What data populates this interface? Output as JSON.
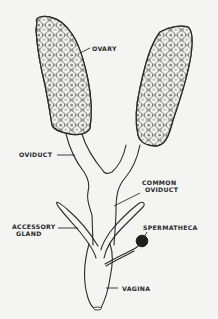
{
  "diagram": {
    "title": "",
    "labels": {
      "ovary": "OVARY",
      "oviduct": "OVIDUCT",
      "common_oviduct_line1": "COMMON",
      "common_oviduct_line2": "OVIDUCT",
      "accessory_gland_line1": "ACCESSORY",
      "accessory_gland_line2": "GLAND",
      "spermatheca": "SPERMATHECA",
      "vagina": "VAGINA"
    },
    "structures": [
      {
        "name": "ovary-left",
        "type": "paired ovary",
        "fill": "cellular"
      },
      {
        "name": "ovary-right",
        "type": "paired ovary",
        "fill": "cellular"
      },
      {
        "name": "oviduct-left",
        "type": "lateral oviduct"
      },
      {
        "name": "oviduct-right",
        "type": "lateral oviduct"
      },
      {
        "name": "common-oviduct",
        "type": "duct"
      },
      {
        "name": "accessory-gland-left",
        "type": "gland"
      },
      {
        "name": "accessory-gland-right",
        "type": "gland"
      },
      {
        "name": "spermatheca",
        "type": "sac",
        "fill": "dark"
      },
      {
        "name": "vagina",
        "type": "chamber"
      }
    ],
    "colors": {
      "background": "#f4f4f2",
      "line": "#2b2b2b",
      "spermatheca_fill": "#1e1e1e"
    }
  }
}
